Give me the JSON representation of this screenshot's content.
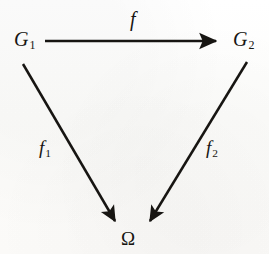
{
  "figure": {
    "kind": "commutative-diagram",
    "background_color": "#fdfdfc",
    "ink_color": "#171512",
    "nodes": [
      {
        "id": "G1",
        "base": "G",
        "subscript": "1",
        "role": "source-object",
        "x": 14,
        "y": 29
      },
      {
        "id": "G2",
        "base": "G",
        "subscript": "2",
        "role": "target-object",
        "x": 233,
        "y": 29
      },
      {
        "id": "Omega",
        "base": "Ω",
        "subscript": "",
        "role": "terminal-object",
        "x": 121,
        "y": 229
      }
    ],
    "arrows": [
      {
        "id": "f",
        "label": "f",
        "subscript": "",
        "from": "G1",
        "to": "G2",
        "orientation": "horizontal",
        "x1": 45,
        "y1": 41,
        "x2": 222,
        "y2": 41,
        "label_x": 130,
        "label_y": 9
      },
      {
        "id": "f1",
        "label": "f",
        "subscript": "1",
        "from": "G1",
        "to": "Omega",
        "orientation": "diagonal-down-right",
        "x1": 23,
        "y1": 64,
        "x2": 119,
        "y2": 227,
        "label_x": 39,
        "label_y": 138
      },
      {
        "id": "f2",
        "label": "f",
        "subscript": "2",
        "from": "G2",
        "to": "Omega",
        "orientation": "diagonal-down-left",
        "x1": 247,
        "y1": 62,
        "x2": 146,
        "y2": 228,
        "label_x": 206,
        "label_y": 138
      }
    ],
    "labels": {
      "g1_base": "G",
      "g1_sub": "1",
      "g2_base": "G",
      "g2_sub": "2",
      "f_base": "f",
      "f1_base": "f",
      "f1_sub": "1",
      "f2_base": "f",
      "f2_sub": "2",
      "omega": "Ω"
    }
  }
}
